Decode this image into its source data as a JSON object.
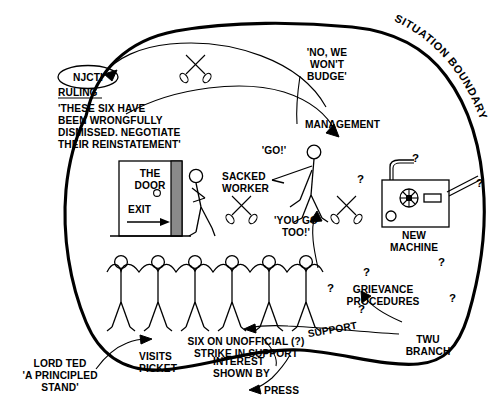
{
  "diagram": {
    "boundary_label": "SITUATION BOUNDARY",
    "labels": {
      "njcti": "NJCTI",
      "ruling_heading": "RULING",
      "ruling_quote_line1": "'THESE SIX HAVE",
      "ruling_quote_line2": "BEEN WRONGFULLY",
      "ruling_quote_line3": "DISMISSED. NEGOTIATE",
      "ruling_quote_line4": "THEIR REINSTATEMENT'",
      "no_budge_line1": "'NO, WE",
      "no_budge_line2": "WON'T",
      "no_budge_line3": "BUDGE'",
      "management": "MANAGEMENT",
      "go": "'GO!'",
      "you_go_too_line1": "'YOU GO",
      "you_go_too_line2": "TOO!'",
      "the_door_line1": "THE",
      "the_door_line2": "DOOR",
      "exit": "EXIT",
      "sacked_worker_line1": "SACKED",
      "sacked_worker_line2": "WORKER",
      "new_machine_line1": "NEW",
      "new_machine_line2": "MACHINE",
      "grievance_line1": "GRIEVANCE",
      "grievance_line2": "PROCEDURES",
      "support": "SUPPORT",
      "twu_line1": "TWU",
      "twu_line2": "BRANCH",
      "strike_line1": "SIX ON UNOFFICIAL (?)",
      "strike_line2": "STRIKE IN SUPPORT",
      "visits_line1": "VISITS",
      "visits_line2": "PICKET",
      "interest_line1": "INTEREST",
      "interest_line2": "SHOWN BY",
      "press": "PRESS",
      "lord_ted_line1": "LORD TED",
      "lord_ted_line2": "'A PRINCIPLED",
      "lord_ted_line3": "STAND'",
      "question_mark": "?"
    },
    "colors": {
      "ink": "#000000",
      "paper": "#ffffff",
      "door_edge": "#808080"
    },
    "counts": {
      "picket_figures": 6,
      "question_marks_around_machine": 3,
      "question_marks_around_grievance": 4,
      "crossed_tool_symbols": 3
    }
  }
}
